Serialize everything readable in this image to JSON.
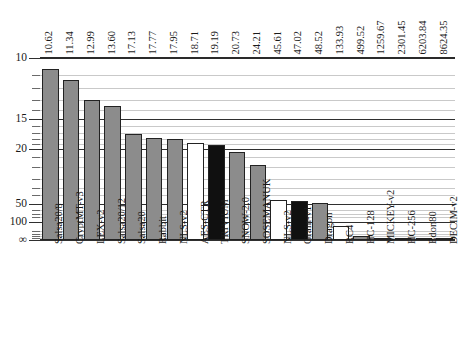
{
  "chart_data": {
    "type": "bar",
    "title": "",
    "xlabel": "",
    "ylabel": "",
    "yscale": "reciprocal",
    "grid": true,
    "legend": "none",
    "categories": [
      "Salsa20/8",
      "CryptMT-v3",
      "LEX-v2",
      "Salsa20/12",
      "Salsa20",
      "Rabbit",
      "NLS-v2",
      "AES-CTR",
      "TRIVIUM",
      "SNOW-2.0",
      "SOSEMANUK",
      "NLS-v2",
      "Grain-v1",
      "Dragon",
      "RC4",
      "HC-128",
      "MICKEY-v2",
      "HC-256",
      "Edon80",
      "DECIM-v2"
    ],
    "values": [
      10.62,
      11.34,
      12.99,
      13.6,
      17.13,
      17.77,
      17.95,
      18.71,
      19.19,
      20.73,
      24.21,
      45.61,
      47.02,
      48.52,
      133.93,
      499.52,
      1259.67,
      2301.45,
      6203.84,
      8624.35
    ],
    "value_labels": [
      "10.62",
      "11.34",
      "12.99",
      "13.60",
      "17.13",
      "17.77",
      "17.95",
      "18.71",
      "19.19",
      "20.73",
      "24.21",
      "45.61",
      "47.02",
      "48.52",
      "133.93",
      "499.52",
      "1259.67",
      "2301.45",
      "6203.84",
      "8624.35"
    ],
    "bar_styles": [
      "gray",
      "gray",
      "gray",
      "gray",
      "gray",
      "gray",
      "gray",
      "white",
      "black",
      "gray",
      "gray",
      "white",
      "black",
      "gray",
      "white",
      "gray",
      "white",
      "gray",
      "gray",
      "gray"
    ],
    "ytick_labels": [
      "10",
      "15",
      "20",
      "50",
      "100",
      "∞"
    ],
    "ytick_values": [
      10,
      15,
      20,
      50,
      100,
      0
    ],
    "yminor_values": [
      11,
      12,
      13,
      14,
      16,
      17,
      18,
      19,
      22,
      25,
      30,
      35,
      40,
      60,
      70,
      80,
      200,
      300,
      500,
      1000
    ],
    "ylim_top": 10,
    "ylim_bottom_label": "∞",
    "colors": {
      "bar_gray": "#8c8c8c",
      "bar_black": "#101010",
      "bar_white": "#ffffff",
      "bar_border": "#222222",
      "axis": "#2a2a2a",
      "gridline_minor": "#c9c9c9",
      "gridline_major": "#2f2f2f",
      "text": "#1a1a1a"
    }
  },
  "caption": {
    "text": ""
  }
}
